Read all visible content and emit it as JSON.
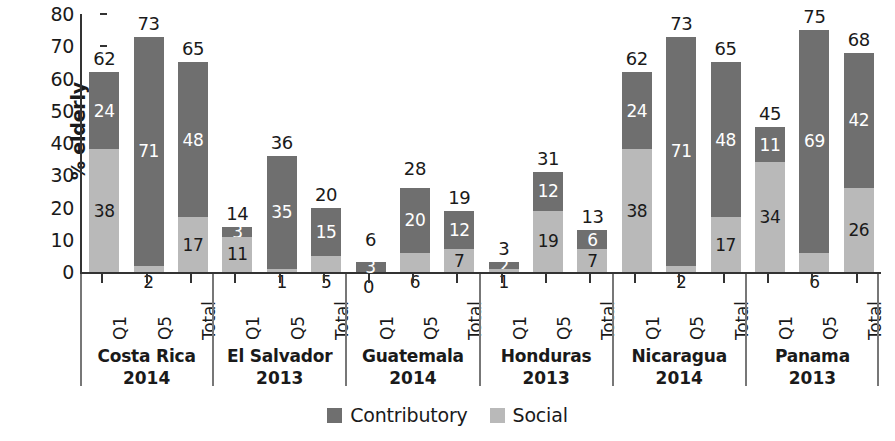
{
  "chart_data": {
    "type": "bar",
    "subtype": "stacked-bar-grouped",
    "title": "",
    "xlabel": "",
    "ylabel": "% elderly",
    "ylim": [
      0,
      80
    ],
    "yticks": [
      0,
      10,
      20,
      30,
      40,
      50,
      60,
      70,
      80
    ],
    "grid": false,
    "legend_position": "bottom-center",
    "categories": [
      "Q1",
      "Q5",
      "Total"
    ],
    "series": [
      {
        "name": "Contributory",
        "color": "#6f6f6f"
      },
      {
        "name": "Social",
        "color": "#b9b9b9"
      }
    ],
    "groups": [
      {
        "country": "Costa Rica",
        "year": "2014",
        "bars": [
          {
            "category": "Q1",
            "total": 62,
            "contributory": 24,
            "social": 38
          },
          {
            "category": "Q5",
            "total": 73,
            "contributory": 71,
            "social": 2
          },
          {
            "category": "Total",
            "total": 65,
            "contributory": 48,
            "social": 17
          }
        ]
      },
      {
        "country": "El Salvador",
        "year": "2013",
        "bars": [
          {
            "category": "Q1",
            "total": 14,
            "contributory": 3,
            "social": 11
          },
          {
            "category": "Q5",
            "total": 36,
            "contributory": 35,
            "social": 1
          },
          {
            "category": "Total",
            "total": 20,
            "contributory": 15,
            "social": 5
          }
        ]
      },
      {
        "country": "Guatemala",
        "year": "2014",
        "bars": [
          {
            "category": "Q1",
            "total": 6,
            "contributory": 3,
            "social": 0
          },
          {
            "category": "Q5",
            "total": 28,
            "contributory": 20,
            "social": 6
          },
          {
            "category": "Total",
            "total": 19,
            "contributory": 12,
            "social": 7
          }
        ]
      },
      {
        "country": "Honduras",
        "year": "2013",
        "bars": [
          {
            "category": "Q1",
            "total": 3,
            "contributory": 2,
            "social": 1
          },
          {
            "category": "Q5",
            "total": 31,
            "contributory": 12,
            "social": 19
          },
          {
            "category": "Total",
            "total": 13,
            "contributory": 6,
            "social": 7
          }
        ]
      },
      {
        "country": "Nicaragua",
        "year": "2014",
        "bars": [
          {
            "category": "Q1",
            "total": 62,
            "contributory": 24,
            "social": 38
          },
          {
            "category": "Q5",
            "total": 73,
            "contributory": 71,
            "social": 2
          },
          {
            "category": "Total",
            "total": 65,
            "contributory": 48,
            "social": 17
          }
        ]
      },
      {
        "country": "Panama",
        "year": "2013",
        "bars": [
          {
            "category": "Q1",
            "total": 45,
            "contributory": 11,
            "social": 34
          },
          {
            "category": "Q5",
            "total": 75,
            "contributory": 69,
            "social": 6
          },
          {
            "category": "Total",
            "total": 68,
            "contributory": 42,
            "social": 26
          }
        ]
      }
    ]
  },
  "axis": {
    "y_title": "% elderly",
    "y_tick_labels": [
      "0",
      "10",
      "20",
      "30",
      "40",
      "50",
      "60",
      "70",
      "80"
    ]
  },
  "legend": {
    "items": [
      {
        "label": "Contributory",
        "color": "#6f6f6f"
      },
      {
        "label": "Social",
        "color": "#b9b9b9"
      }
    ]
  }
}
